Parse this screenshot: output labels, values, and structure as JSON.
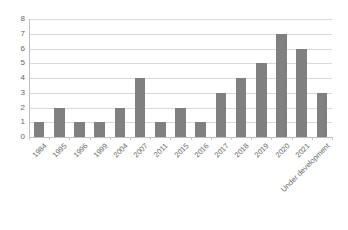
{
  "chart_data": {
    "type": "bar",
    "title": "",
    "subtitle": "",
    "xlabel": "",
    "ylabel": "",
    "categories": [
      "1984",
      "1995",
      "1996",
      "1999",
      "2004",
      "2007",
      "2011",
      "2015",
      "2016",
      "2017",
      "2018",
      "2019",
      "2020",
      "2021",
      "Under development"
    ],
    "values": [
      1,
      2,
      1,
      1,
      2,
      4,
      1,
      2,
      1,
      3,
      4,
      5,
      7,
      6,
      3
    ],
    "series": [
      {
        "name": "",
        "values": [
          1,
          2,
          1,
          1,
          2,
          4,
          1,
          2,
          1,
          3,
          4,
          5,
          7,
          6,
          3
        ]
      }
    ],
    "ylim": [
      0,
      8
    ],
    "ytick_labels": [
      "0",
      "1",
      "2",
      "3",
      "4",
      "5",
      "6",
      "7",
      "8"
    ],
    "ytick_values": [
      0,
      1,
      2,
      3,
      4,
      5,
      6,
      7,
      8
    ],
    "grid": true,
    "grid_axis": "y",
    "legend": false,
    "legend_position": "none",
    "annotations": []
  },
  "style": {
    "bar_color": "#808080",
    "grid_color": "#d9d9d9",
    "axis_color": "#bfbfbf",
    "tick_label_color": "#666666",
    "category_label_color": "#6b6b6b",
    "background_color": "#ffffff"
  }
}
